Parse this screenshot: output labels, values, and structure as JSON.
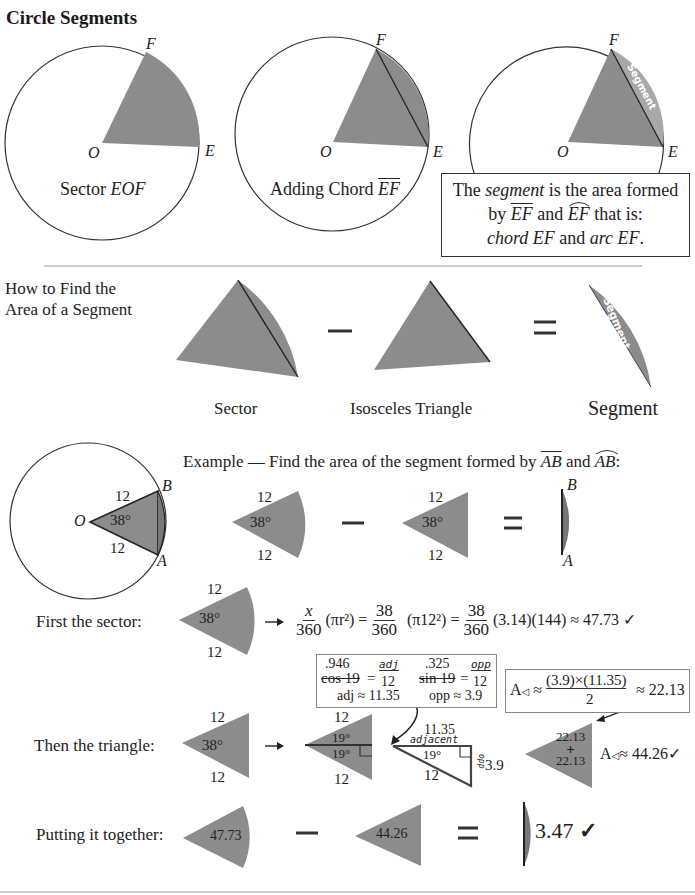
{
  "title": "Circle Segments",
  "top_row": {
    "panel1": {
      "caption_prefix": "Sector ",
      "caption_italic": "EOF",
      "labels": {
        "O": "O",
        "E": "E",
        "F": "F"
      }
    },
    "panel2": {
      "caption_prefix": "Adding Chord ",
      "caption_chord": "EF",
      "labels": {
        "O": "O",
        "E": "E",
        "F": "F"
      }
    },
    "panel3": {
      "labels": {
        "O": "O",
        "E": "E",
        "F": "F"
      },
      "segment_word": "Segment"
    },
    "definition_box": {
      "line1_pre": "The ",
      "line1_it": "segment",
      "line1_post": " is the area formed",
      "line2_by": "by ",
      "line2_chord": "EF",
      "line2_and": " and ",
      "line2_arc": "EF",
      "line2_post": " that is:",
      "line3_chord": "chord EF",
      "line3_and": " and ",
      "line3_arc": "arc EF",
      "line3_end": "."
    }
  },
  "how_to": {
    "heading_line1": "How to Find the",
    "heading_line2": "Area of a Segment",
    "minus": "−",
    "equals": "=",
    "sector_label": "Sector",
    "triangle_label": "Isosceles Triangle",
    "segment_label": "Segment",
    "segment_word": "Segment"
  },
  "example": {
    "prompt_pre": "Example — Find the area of the segment formed by ",
    "chord": "AB",
    "and": " and ",
    "arc": "AB",
    "colon": ":",
    "circle": {
      "O": "O",
      "A": "A",
      "B": "B",
      "radius": "12",
      "angle": "38°"
    },
    "sector": {
      "radius": "12",
      "angle": "38°"
    },
    "triangle": {
      "radius": "12",
      "angle": "38°"
    },
    "minus": "−",
    "equals": "=",
    "segment_labels": {
      "A": "A",
      "B": "B"
    }
  },
  "first_sector": {
    "label": "First the sector:",
    "radius": "12",
    "angle": "38°",
    "arrow": "→",
    "formula": {
      "f1_num": "x",
      "f1_den": "360",
      "f1_paren": "(πr²)",
      "eq1": "=",
      "f2_num": "38",
      "f2_den": "360",
      "f2_paren": "(π12²)",
      "eq2": "=",
      "f3_num": "38",
      "f3_den": "360",
      "f3_tail": "(3.14)(144) ≈ 47.73 ✓"
    }
  },
  "trig_box": {
    "cos_val": ".946",
    "cos_label": "cos 19",
    "cos_eq": "=",
    "cos_num": "adj",
    "cos_den": "12",
    "sin_val": ".325",
    "sin_label": "sin 19",
    "sin_eq": "=",
    "sin_num": "opp",
    "sin_den": "12",
    "adj_result": "adj ≈ 11.35",
    "opp_result": "opp ≈ 3.9"
  },
  "area_box": {
    "lhs": "A",
    "approx": "≈",
    "num": "(3.9)×(11.35)",
    "den": "2",
    "result": "≈ 22.13"
  },
  "then_triangle": {
    "label": "Then the triangle:",
    "radius": "12",
    "angle": "38°",
    "arrow": "→",
    "split": {
      "top": "12",
      "bottom": "12",
      "angle_top": "19°",
      "angle_bottom": "19°"
    },
    "right_tri": {
      "adjacent_val": "11.35",
      "adjacent_word": "adjacent",
      "angle": "19°",
      "hyp": "12",
      "opp_word": "opp",
      "opp_val": "3.9"
    },
    "combined": {
      "top": "22.13",
      "plus": "+",
      "bottom": "22.13",
      "total_lhs": "A",
      "total": "≈ 44.26✓"
    }
  },
  "together": {
    "label": "Putting it together:",
    "sector_val": "47.73",
    "minus": "−",
    "triangle_val": "44.26",
    "equals": "=",
    "result": "3.47",
    "check": "✓"
  },
  "colors": {
    "fill": "#8c8c8c",
    "segment_fill": "#a8a8a8",
    "line": "#333333"
  }
}
